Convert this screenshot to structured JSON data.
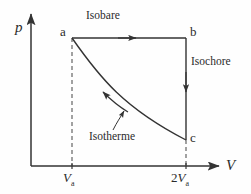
{
  "diagram": {
    "axes": {
      "y_label": "p",
      "x_label": "V"
    },
    "points": [
      {
        "id": "a",
        "label": "a"
      },
      {
        "id": "b",
        "label": "b"
      },
      {
        "id": "c",
        "label": "c"
      }
    ],
    "processes": [
      {
        "id": "isobare",
        "label": "Isobare",
        "from": "a",
        "to": "b"
      },
      {
        "id": "isochore",
        "label": "Isochore",
        "from": "b",
        "to": "c"
      },
      {
        "id": "isotherme",
        "label": "Isotherme",
        "from": "c",
        "to": "a"
      }
    ],
    "ticks": [
      {
        "id": "v-a",
        "value_prefix": "",
        "symbol": "V",
        "subscript": "a"
      },
      {
        "id": "2-v-a",
        "value_prefix": "2",
        "symbol": "V",
        "subscript": "a"
      }
    ],
    "colors": {
      "stroke": "#333333",
      "background": "#fefefe",
      "text": "#2b2b2b"
    }
  }
}
